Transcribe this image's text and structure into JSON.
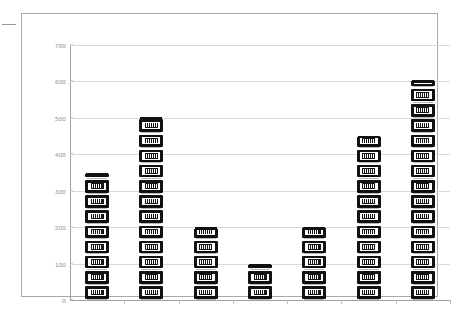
{
  "chart_data": {
    "type": "bar",
    "title": "",
    "subtitle": "",
    "xlabel": "",
    "ylabel": "",
    "categories": [
      "",
      "",
      "",
      "",
      "",
      "",
      ""
    ],
    "values": [
      345,
      500,
      196,
      95,
      197,
      447,
      600
    ],
    "series": [
      {
        "name": "",
        "values": [
          345,
          500,
          196,
          95,
          197,
          447,
          600
        ]
      }
    ],
    "ylim": [
      0,
      700
    ],
    "yticks": [
      0,
      100,
      200,
      300,
      400,
      500,
      600,
      700
    ],
    "ytick_labels": [
      "0",
      "100",
      "200",
      "300",
      "400",
      "500",
      "600",
      "700"
    ],
    "xticks_visible": true,
    "xtick_labels": [
      "",
      "",
      "",
      "",
      "",
      "",
      ""
    ],
    "grid": true,
    "grid_axis": "y",
    "legend": false,
    "legend_position": "none",
    "marker_style": "pictograph-stacked-icon",
    "icon_name": "bank-building-icon",
    "icon_unit_value": 25,
    "colors": {
      "bar_fill": "#121212",
      "bar_accent": "#ffffff",
      "gridline": "#d9d9d9",
      "axis": "#a0a0a0",
      "tick_label": "#8e8e8e",
      "frame_border": "#a8a8a8",
      "plot_background": "#ffffff"
    },
    "annotations": []
  }
}
